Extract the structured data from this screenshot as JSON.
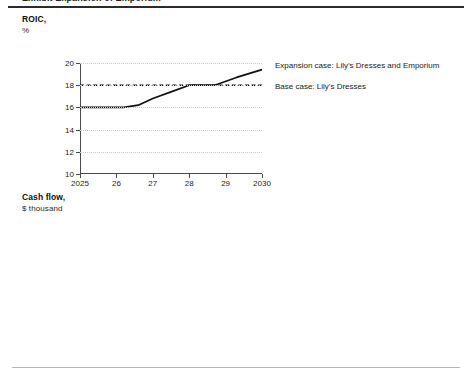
{
  "exhibit": {
    "title": "Exhibit  Expansion of Emporium"
  },
  "panels": [
    {
      "title": "ROIC,",
      "subtitle": "%",
      "legend": [
        {
          "label": "Expansion case: Lily’s Dresses and Emporium",
          "style": "solid"
        },
        {
          "label": "Base case: Lily’s Dresses",
          "style": "dashed"
        }
      ]
    },
    {
      "title": "Cash flow,",
      "subtitle": "$ thousand",
      "legend": [
        {
          "label": "Expansion case: Lily’s Dresses and Emporium",
          "style": "solid"
        },
        {
          "label": "Base case: Lily’s Dresses",
          "style": "dashed"
        }
      ]
    }
  ],
  "chart_data": [
    {
      "type": "line",
      "title": "ROIC,",
      "ylabel": "%",
      "xlabel": "",
      "x": [
        2025,
        2026,
        2027,
        2028,
        2029,
        2030
      ],
      "xticklabels": [
        "2025",
        "26",
        "27",
        "28",
        "29",
        "2030"
      ],
      "ylim": [
        10,
        20
      ],
      "yticks": [
        10,
        12,
        14,
        16,
        18,
        20
      ],
      "yticklabels": [
        "10",
        "12",
        "14",
        "16",
        "18",
        "20"
      ],
      "grid": true,
      "legend_position": "right",
      "series": [
        {
          "name": "Expansion case: Lily’s Dresses and Emporium",
          "style": "solid",
          "x": [
            2025,
            2026.2,
            2026.6,
            2027,
            2027.5,
            2028,
            2028.7,
            2029.3,
            2030
          ],
          "values": [
            16.0,
            16.0,
            16.2,
            16.8,
            17.4,
            18.0,
            18.0,
            18.7,
            19.4
          ]
        },
        {
          "name": "Base case: Lily’s Dresses",
          "style": "dashed",
          "x": [
            2025,
            2030
          ],
          "values": [
            18.0,
            18.0
          ]
        }
      ]
    },
    {
      "type": "line",
      "title": "Cash flow,",
      "ylabel": "$ thousand",
      "xlabel": "",
      "x": [
        2025,
        2026,
        2027,
        2028,
        2029,
        2030
      ],
      "xticklabels": [
        "2025",
        "26",
        "27",
        "28",
        "29",
        "2030"
      ],
      "ylim": [
        0,
        2000
      ],
      "yticks": [
        0,
        500,
        1000,
        1500,
        2000
      ],
      "yticklabels": [
        "0",
        "500",
        "1,000",
        "1,500",
        "2,000"
      ],
      "grid": true,
      "legend_position": "right",
      "series": [
        {
          "name": "Expansion case: Lily’s Dresses and Emporium",
          "style": "solid",
          "x": [
            2025,
            2026,
            2027,
            2028,
            2029,
            2030
          ],
          "values": [
            650,
            790,
            1150,
            1500,
            1810,
            2000
          ]
        },
        {
          "name": "Base case: Lily’s Dresses",
          "style": "dashed",
          "x": [
            2025,
            2026,
            2027,
            2028,
            2029,
            2030
          ],
          "values": [
            1300,
            1350,
            1420,
            1490,
            1580,
            1650
          ]
        }
      ]
    }
  ]
}
